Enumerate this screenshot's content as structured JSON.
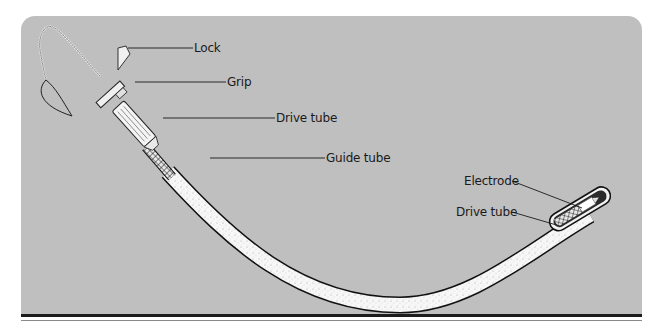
{
  "figure": {
    "background_color": "#bfbfbf",
    "labels": {
      "lock": "Lock",
      "grip": "Grip",
      "drive_tube_top": "Drive tube",
      "guide_tube": "Guide tube",
      "electrode": "Electrode",
      "drive_tube_tip": "Drive tube"
    }
  }
}
